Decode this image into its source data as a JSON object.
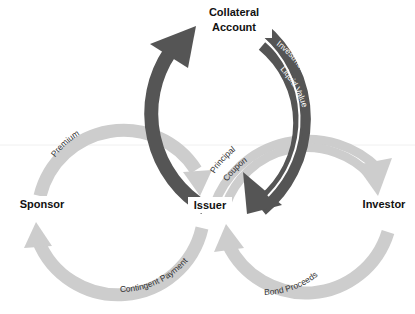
{
  "nodes": {
    "collateral_line1": "Collateral",
    "collateral_line2": "Account",
    "sponsor": "Sponsor",
    "issuer": "Issuer",
    "investor": "Investor"
  },
  "flows": {
    "premium": "Premium",
    "contingent_payment": "Contingent Payment",
    "par_value": "Par Value",
    "investment_returns": "Investment Returns",
    "liquid_value": "Liquid Value",
    "principal": "Principal",
    "coupon": "Coupon",
    "bond_proceeds": "Bond Proceeds"
  },
  "colors": {
    "dark_arrow": "#555555",
    "light_arrow": "#cdcdcd",
    "text": "#111111",
    "background": "#ffffff"
  }
}
